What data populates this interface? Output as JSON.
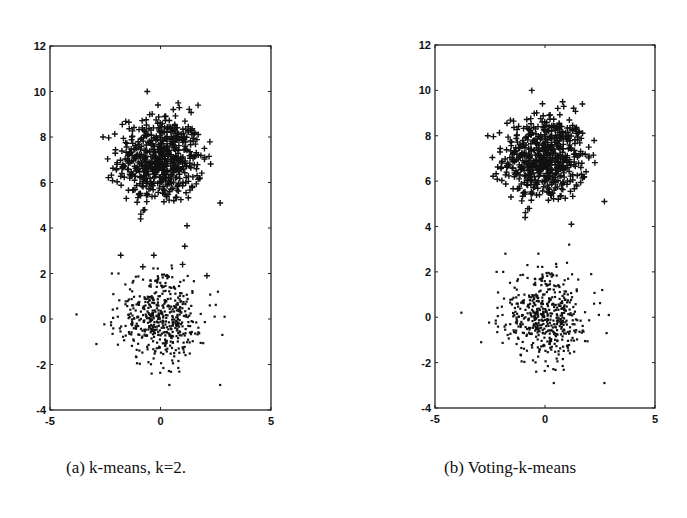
{
  "figure": {
    "panels": [
      {
        "id": "a",
        "caption": "(a) k-means, k=2."
      },
      {
        "id": "b",
        "caption": "(b) Voting-k-means"
      }
    ]
  },
  "chart_data": [
    {
      "type": "scatter",
      "title": "(a) k-means, k=2.",
      "xlabel": "",
      "ylabel": "",
      "xlim": [
        -5,
        5
      ],
      "ylim": [
        -4,
        12
      ],
      "xticks": [
        -5,
        0,
        5
      ],
      "yticks": [
        -4,
        -2,
        0,
        2,
        4,
        6,
        8,
        10,
        12
      ],
      "grid": false,
      "legend": null,
      "series": [
        {
          "name": "cluster 1 (+)",
          "marker": "+",
          "center": [
            0,
            7
          ],
          "std": 1.0,
          "approx_count": 600,
          "outliers": [
            [
              -0.6,
              10.0
            ],
            [
              0.8,
              9.5
            ],
            [
              1.7,
              9.4
            ],
            [
              -2.6,
              8.0
            ],
            [
              2.0,
              7.1
            ],
            [
              2.7,
              5.1
            ],
            [
              -0.9,
              4.4
            ],
            [
              1.2,
              4.1
            ],
            [
              1.1,
              3.2
            ],
            [
              -1.8,
              2.8
            ],
            [
              -0.3,
              2.8
            ],
            [
              -0.8,
              2.3
            ],
            [
              1.0,
              2.4
            ],
            [
              2.1,
              1.9
            ]
          ]
        },
        {
          "name": "cluster 2 (·)",
          "marker": ".",
          "center": [
            0,
            0
          ],
          "std": 1.0,
          "approx_count": 500,
          "outliers": [
            [
              -3.8,
              0.2
            ],
            [
              -2.9,
              -1.1
            ],
            [
              2.9,
              0.1
            ],
            [
              2.8,
              -0.7
            ],
            [
              2.6,
              1.2
            ],
            [
              2.7,
              -2.9
            ],
            [
              0.4,
              -2.9
            ],
            [
              -2.2,
              2.0
            ],
            [
              -1.9,
              2.0
            ],
            [
              -0.4,
              -2.4
            ]
          ]
        }
      ]
    },
    {
      "type": "scatter",
      "title": "(b) Voting-k-means",
      "xlabel": "",
      "ylabel": "",
      "xlim": [
        -5,
        5
      ],
      "ylim": [
        -4,
        12
      ],
      "xticks": [
        -5,
        0,
        5
      ],
      "yticks": [
        -4,
        -2,
        0,
        2,
        4,
        6,
        8,
        10,
        12
      ],
      "grid": false,
      "legend": null,
      "series": [
        {
          "name": "cluster 1 (+)",
          "marker": "+",
          "center": [
            0,
            7
          ],
          "std": 1.0,
          "approx_count": 600,
          "outliers": [
            [
              -0.6,
              10.0
            ],
            [
              0.8,
              9.5
            ],
            [
              1.7,
              9.4
            ],
            [
              -2.6,
              8.0
            ],
            [
              2.0,
              7.1
            ],
            [
              2.7,
              5.1
            ],
            [
              -0.9,
              4.4
            ],
            [
              1.2,
              4.1
            ]
          ]
        },
        {
          "name": "cluster 2 (·)",
          "marker": ".",
          "center": [
            0,
            0
          ],
          "std": 1.0,
          "approx_count": 500,
          "outliers": [
            [
              1.1,
              3.2
            ],
            [
              -1.8,
              2.8
            ],
            [
              -0.3,
              2.8
            ],
            [
              -0.8,
              2.3
            ],
            [
              1.0,
              2.4
            ],
            [
              2.1,
              1.9
            ],
            [
              -3.8,
              0.2
            ],
            [
              -2.9,
              -1.1
            ],
            [
              2.9,
              0.1
            ],
            [
              2.8,
              -0.7
            ],
            [
              2.6,
              1.2
            ],
            [
              2.7,
              -2.9
            ],
            [
              0.4,
              -2.9
            ],
            [
              -2.2,
              2.0
            ],
            [
              -1.9,
              2.0
            ],
            [
              -0.4,
              -2.4
            ]
          ]
        }
      ]
    }
  ],
  "layout": {
    "panels": [
      {
        "frame": {
          "left": 50,
          "top": 46,
          "right": 271,
          "bottom": 410
        }
      },
      {
        "frame": {
          "left": 435,
          "top": 45,
          "right": 655,
          "bottom": 408
        }
      }
    ],
    "marker_color": "#111111",
    "axis_color": "#222222"
  }
}
